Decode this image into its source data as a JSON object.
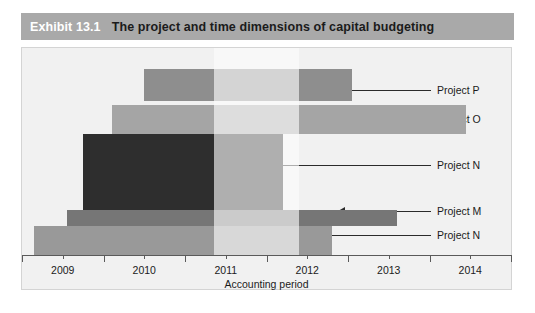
{
  "header": {
    "exhibit_number": "Exhibit 13.1",
    "title": "The project and time dimensions of capital budgeting",
    "band_color": "#a9a9a9",
    "number_color": "#ffffff",
    "title_color": "#1b1b1b"
  },
  "chart_data": {
    "type": "bar",
    "orientation": "horizontal",
    "title": "The project and time dimensions of capital budgeting",
    "xlabel": "Accounting period",
    "ylabel": "",
    "xlim": [
      2008.5,
      2014.5
    ],
    "grid": false,
    "legend_position": "right-labels-with-leader-lines",
    "x_ticks": [
      2009,
      2010,
      2011,
      2012,
      2013,
      2014
    ],
    "x_tick_labels": [
      "2009",
      "2010",
      "2011",
      "2012",
      "2013",
      "2014"
    ],
    "highlight_band": {
      "label": "2011",
      "start": 2010.85,
      "end": 2011.9,
      "color": "#ededed"
    },
    "categories": [
      "Project P",
      "Project O",
      "Project N",
      "Project M",
      "Project N"
    ],
    "series": [
      {
        "name": "Project P",
        "start": 2010.0,
        "end": 2012.55,
        "color": "#8e8e8e",
        "row": 0
      },
      {
        "name": "Project O",
        "start": 2009.6,
        "end": 2013.95,
        "color": "#a5a5a5",
        "row": 1
      },
      {
        "name": "Project N",
        "start": 2009.25,
        "end": 2011.7,
        "color": "#2e2e2e",
        "row": 2
      },
      {
        "name": "Project M",
        "start": 2009.05,
        "end": 2013.1,
        "color": "#767676",
        "row": 3
      },
      {
        "name": "Project N",
        "start": 2008.65,
        "end": 2012.3,
        "color": "#999999",
        "row": 4
      }
    ]
  },
  "axis": {
    "title": "Accounting period",
    "line_color": "#5a5a5a",
    "label_color": "#1b1b1b"
  },
  "callouts": [
    {
      "label": "Project P"
    },
    {
      "label": "Project O"
    },
    {
      "label": "Project N"
    },
    {
      "label": "Project M"
    },
    {
      "label": "Project N"
    }
  ]
}
